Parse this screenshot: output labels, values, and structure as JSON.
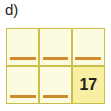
{
  "figure": {
    "panel_label": "d)",
    "colors": {
      "cell_fill": "#fdfbdf",
      "cell_fill_highlight": "#f9efa3",
      "grid_border": "#c8c04a",
      "bar": "#cf8a2a",
      "text": "#231f20",
      "background": "#ffffff"
    },
    "grid": {
      "columns": 3,
      "rows": 2,
      "cells": [
        {
          "id": "r1c1",
          "row": 1,
          "col": 1,
          "value": "",
          "has_bar": true,
          "highlighted": false
        },
        {
          "id": "r1c2",
          "row": 1,
          "col": 2,
          "value": "",
          "has_bar": true,
          "highlighted": false
        },
        {
          "id": "r1c3",
          "row": 1,
          "col": 3,
          "value": "",
          "has_bar": true,
          "highlighted": false
        },
        {
          "id": "r2c1",
          "row": 2,
          "col": 1,
          "value": "",
          "has_bar": true,
          "highlighted": false
        },
        {
          "id": "r2c2",
          "row": 2,
          "col": 2,
          "value": "",
          "has_bar": true,
          "highlighted": false
        },
        {
          "id": "r2c3",
          "row": 2,
          "col": 3,
          "value": "17",
          "has_bar": false,
          "highlighted": true
        }
      ]
    }
  }
}
